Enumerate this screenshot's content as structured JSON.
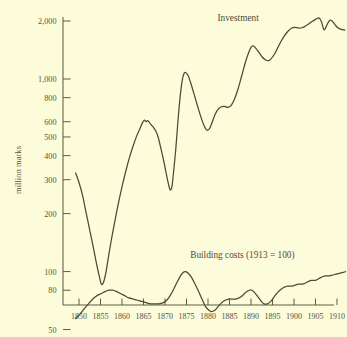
{
  "chart_data": {
    "type": "line",
    "title": "",
    "xlabel": "",
    "ylabel": "million marks",
    "log_y": true,
    "ylim": [
      45,
      2200
    ],
    "xlim": [
      1848,
      1913
    ],
    "grid": false,
    "legend_position": "inline-annotations",
    "y_ticks": [
      {
        "value": 2000,
        "label": "2,000"
      },
      {
        "value": 1000,
        "label": "1,000"
      },
      {
        "value": 800,
        "label": "800"
      },
      {
        "value": 600,
        "label": "600"
      },
      {
        "value": 500,
        "label": "500"
      },
      {
        "value": 400,
        "label": "400"
      },
      {
        "value": 300,
        "label": "300"
      },
      {
        "value": 200,
        "label": "200"
      },
      {
        "value": 100,
        "label": "100"
      },
      {
        "value": 80,
        "label": "80"
      },
      {
        "value": 50,
        "label": "50"
      }
    ],
    "x_ticks": [
      {
        "value": 1850,
        "label": "1850"
      },
      {
        "value": 1855,
        "label": "1855"
      },
      {
        "value": 1860,
        "label": "1860"
      },
      {
        "value": 1865,
        "label": "1865"
      },
      {
        "value": 1870,
        "label": "1870"
      },
      {
        "value": 1875,
        "label": "1875"
      },
      {
        "value": 1880,
        "label": "1880"
      },
      {
        "value": 1885,
        "label": "1885"
      },
      {
        "value": 1890,
        "label": "1890"
      },
      {
        "value": 1895,
        "label": "1895"
      },
      {
        "value": 1900,
        "label": "1900"
      },
      {
        "value": 1905,
        "label": "1905"
      },
      {
        "value": 1910,
        "label": "1910"
      }
    ],
    "annotations": [
      {
        "name": "investment-label",
        "text": "Investment",
        "x": 1887,
        "y": 2000
      },
      {
        "name": "building-costs-label",
        "text": "Building costs (1913 = 100)",
        "x": 1888,
        "y": 118
      }
    ],
    "series": [
      {
        "name": "Investment",
        "unit": "million marks",
        "points": [
          [
            1849.2,
            325
          ],
          [
            1850.0,
            290
          ],
          [
            1850.8,
            250
          ],
          [
            1851.6,
            205
          ],
          [
            1852.4,
            168
          ],
          [
            1853.2,
            138
          ],
          [
            1854.0,
            112
          ],
          [
            1854.7,
            95
          ],
          [
            1855.2,
            86
          ],
          [
            1855.7,
            88
          ],
          [
            1856.3,
            100
          ],
          [
            1857.0,
            125
          ],
          [
            1857.8,
            158
          ],
          [
            1858.6,
            196
          ],
          [
            1859.4,
            240
          ],
          [
            1860.2,
            288
          ],
          [
            1861.0,
            340
          ],
          [
            1861.8,
            395
          ],
          [
            1862.6,
            450
          ],
          [
            1863.4,
            505
          ],
          [
            1864.2,
            555
          ],
          [
            1864.8,
            595
          ],
          [
            1865.2,
            612
          ],
          [
            1865.6,
            600
          ],
          [
            1866.0,
            608
          ],
          [
            1866.6,
            585
          ],
          [
            1867.2,
            565
          ],
          [
            1867.8,
            540
          ],
          [
            1868.4,
            500
          ],
          [
            1869.0,
            440
          ],
          [
            1869.6,
            385
          ],
          [
            1870.2,
            330
          ],
          [
            1870.8,
            285
          ],
          [
            1871.2,
            266
          ],
          [
            1871.6,
            275
          ],
          [
            1872.0,
            330
          ],
          [
            1872.5,
            430
          ],
          [
            1873.0,
            600
          ],
          [
            1873.5,
            800
          ],
          [
            1874.0,
            980
          ],
          [
            1874.4,
            1065
          ],
          [
            1874.8,
            1080
          ],
          [
            1875.4,
            1040
          ],
          [
            1876.0,
            950
          ],
          [
            1876.8,
            830
          ],
          [
            1877.6,
            720
          ],
          [
            1878.4,
            630
          ],
          [
            1879.2,
            565
          ],
          [
            1879.8,
            542
          ],
          [
            1880.4,
            555
          ],
          [
            1881.0,
            600
          ],
          [
            1881.6,
            650
          ],
          [
            1882.2,
            690
          ],
          [
            1883.0,
            715
          ],
          [
            1883.8,
            720
          ],
          [
            1884.6,
            712
          ],
          [
            1885.4,
            730
          ],
          [
            1886.2,
            790
          ],
          [
            1887.0,
            890
          ],
          [
            1887.8,
            1030
          ],
          [
            1888.6,
            1200
          ],
          [
            1889.4,
            1360
          ],
          [
            1890.0,
            1460
          ],
          [
            1890.5,
            1485
          ],
          [
            1891.0,
            1455
          ],
          [
            1891.8,
            1380
          ],
          [
            1892.6,
            1300
          ],
          [
            1893.4,
            1255
          ],
          [
            1894.0,
            1245
          ],
          [
            1894.6,
            1268
          ],
          [
            1895.4,
            1340
          ],
          [
            1896.2,
            1450
          ],
          [
            1897.0,
            1570
          ],
          [
            1897.8,
            1680
          ],
          [
            1898.6,
            1770
          ],
          [
            1899.4,
            1835
          ],
          [
            1900.2,
            1855
          ],
          [
            1901.0,
            1840
          ],
          [
            1901.8,
            1845
          ],
          [
            1902.6,
            1880
          ],
          [
            1903.4,
            1930
          ],
          [
            1904.2,
            1990
          ],
          [
            1905.0,
            2040
          ],
          [
            1905.6,
            2072
          ],
          [
            1906.0,
            2060
          ],
          [
            1906.4,
            1975
          ],
          [
            1906.8,
            1840
          ],
          [
            1907.1,
            1800
          ],
          [
            1907.5,
            1870
          ],
          [
            1908.0,
            1975
          ],
          [
            1908.5,
            2020
          ],
          [
            1909.0,
            1985
          ],
          [
            1909.6,
            1905
          ],
          [
            1910.2,
            1845
          ],
          [
            1911.0,
            1810
          ],
          [
            1911.8,
            1795
          ]
        ]
      },
      {
        "name": "Building costs (1913 = 100)",
        "unit": "index, 1913 = 100",
        "points": [
          [
            1849.2,
            57
          ],
          [
            1850.2,
            60
          ],
          [
            1851.2,
            64
          ],
          [
            1852.2,
            68
          ],
          [
            1853.2,
            72
          ],
          [
            1854.2,
            75
          ],
          [
            1855.2,
            77
          ],
          [
            1856.2,
            79
          ],
          [
            1857.0,
            80
          ],
          [
            1857.8,
            80
          ],
          [
            1858.6,
            79
          ],
          [
            1859.6,
            77
          ],
          [
            1860.6,
            75
          ],
          [
            1861.6,
            73
          ],
          [
            1862.6,
            72
          ],
          [
            1863.6,
            71
          ],
          [
            1864.6,
            70
          ],
          [
            1865.6,
            69
          ],
          [
            1866.6,
            68
          ],
          [
            1867.6,
            68
          ],
          [
            1868.6,
            68
          ],
          [
            1869.6,
            69
          ],
          [
            1870.4,
            71
          ],
          [
            1871.2,
            75
          ],
          [
            1872.0,
            81
          ],
          [
            1872.8,
            88
          ],
          [
            1873.6,
            95
          ],
          [
            1874.2,
            99
          ],
          [
            1874.8,
            100
          ],
          [
            1875.4,
            98
          ],
          [
            1876.2,
            93
          ],
          [
            1877.0,
            86
          ],
          [
            1877.8,
            79
          ],
          [
            1878.6,
            72
          ],
          [
            1879.4,
            66
          ],
          [
            1880.2,
            63
          ],
          [
            1880.8,
            62
          ],
          [
            1881.6,
            63
          ],
          [
            1882.4,
            66
          ],
          [
            1883.2,
            69
          ],
          [
            1884.0,
            71
          ],
          [
            1884.8,
            72
          ],
          [
            1885.6,
            72
          ],
          [
            1886.4,
            72
          ],
          [
            1887.2,
            73
          ],
          [
            1888.0,
            75
          ],
          [
            1888.8,
            78
          ],
          [
            1889.6,
            80
          ],
          [
            1890.2,
            80
          ],
          [
            1890.8,
            78
          ],
          [
            1891.6,
            74
          ],
          [
            1892.4,
            70
          ],
          [
            1893.0,
            68
          ],
          [
            1893.8,
            68
          ],
          [
            1894.6,
            70
          ],
          [
            1895.4,
            74
          ],
          [
            1896.2,
            78
          ],
          [
            1897.0,
            81
          ],
          [
            1897.8,
            83
          ],
          [
            1898.6,
            84
          ],
          [
            1899.4,
            84
          ],
          [
            1900.2,
            85
          ],
          [
            1901.0,
            86
          ],
          [
            1901.8,
            86
          ],
          [
            1902.6,
            87
          ],
          [
            1903.4,
            89
          ],
          [
            1904.2,
            90
          ],
          [
            1905.0,
            90
          ],
          [
            1905.8,
            92
          ],
          [
            1906.6,
            94
          ],
          [
            1907.4,
            95
          ],
          [
            1908.2,
            95
          ],
          [
            1909.0,
            96
          ],
          [
            1909.8,
            97
          ],
          [
            1910.6,
            98
          ],
          [
            1911.4,
            99
          ],
          [
            1912.0,
            100
          ]
        ]
      }
    ]
  },
  "colors": {
    "background": "#fcfcdb",
    "ink": "#4a4a35",
    "axis": "#5c5c46",
    "text": "#55553f"
  }
}
